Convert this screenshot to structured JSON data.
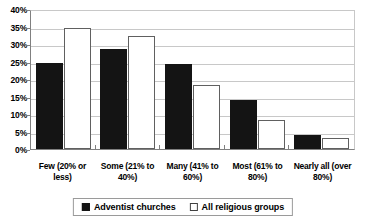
{
  "chart_data": {
    "type": "bar",
    "title": "",
    "xlabel": "",
    "ylabel": "",
    "ylim": [
      0,
      40
    ],
    "grid": true,
    "legend_position": "bottom",
    "categories": [
      "Few (20% or less)",
      "Some (21% to 40%)",
      "Many (41% to 60%)",
      "Most (61% to 80%)",
      "Nearly all (over 80%)"
    ],
    "y_ticks": [
      "0%",
      "5%",
      "10%",
      "15%",
      "20%",
      "25%",
      "30%",
      "35%",
      "40%"
    ],
    "y_tick_values": [
      0,
      5,
      10,
      15,
      20,
      25,
      30,
      35,
      40
    ],
    "series": [
      {
        "name": "Adventist churches",
        "color": "#141414",
        "values": [
          25.0,
          28.9,
          24.6,
          14.3,
          4.2
        ]
      },
      {
        "name": "All religious groups",
        "color": "#ffffff",
        "values": [
          35.0,
          32.8,
          18.5,
          8.4,
          3.1
        ]
      }
    ]
  },
  "legend": {
    "items": [
      {
        "label": "Adventist churches",
        "swatch": "filled-square-icon"
      },
      {
        "label": "All religious groups",
        "swatch": "outlined-square-icon"
      }
    ]
  }
}
